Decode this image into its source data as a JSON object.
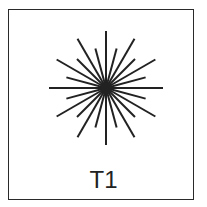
{
  "figure": {
    "label": "T1",
    "stroke_color": "#222222",
    "border_color": "#2a2a2a",
    "star": {
      "center_x": 106,
      "center_y": 88,
      "ray_count": 24,
      "long_radius": 57,
      "short_radius": 41,
      "stroke_width": 2
    }
  }
}
